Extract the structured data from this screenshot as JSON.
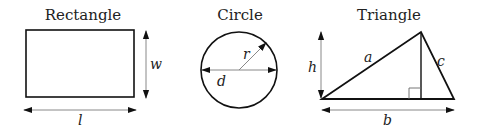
{
  "shapes": {
    "rectangle": {
      "title": "Rectangle",
      "width_label": "w",
      "length_label": "l"
    },
    "circle": {
      "title": "Circle",
      "radius_label": "r",
      "diameter_label": "d"
    },
    "triangle": {
      "title": "Triangle",
      "height_label": "h",
      "side_a_label": "a",
      "side_c_label": "c",
      "base_label": "b"
    }
  },
  "colors": {
    "stroke": "#111111",
    "dimension_line": "#777777",
    "background": "#ffffff"
  }
}
